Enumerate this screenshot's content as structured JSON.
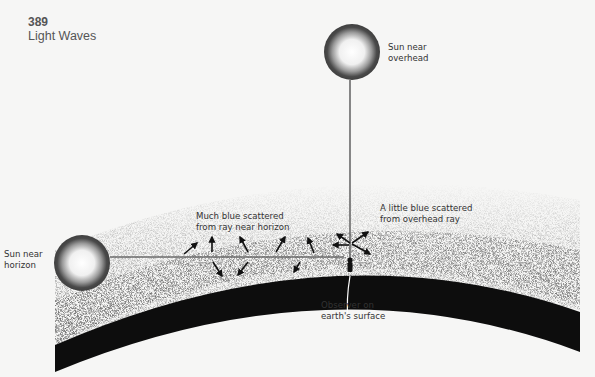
{
  "header": {
    "page_number": "389",
    "section_title": "Light Waves"
  },
  "labels": {
    "sun_overhead": "Sun near\noverhead",
    "sun_horizon": "Sun near\nhorizon",
    "much_blue": "Much blue scattered\nfrom ray near horizon",
    "little_blue": "A little blue scattered\nfrom overhead ray",
    "observer": "Observer on\nearth's surface"
  },
  "colors": {
    "background": "#f6f6f5",
    "sun_disc": "#4a4a4a",
    "ray": "#6a6a6a",
    "earth": "#0d0d0d",
    "atmosphere_dots": "#2a2a2a"
  }
}
